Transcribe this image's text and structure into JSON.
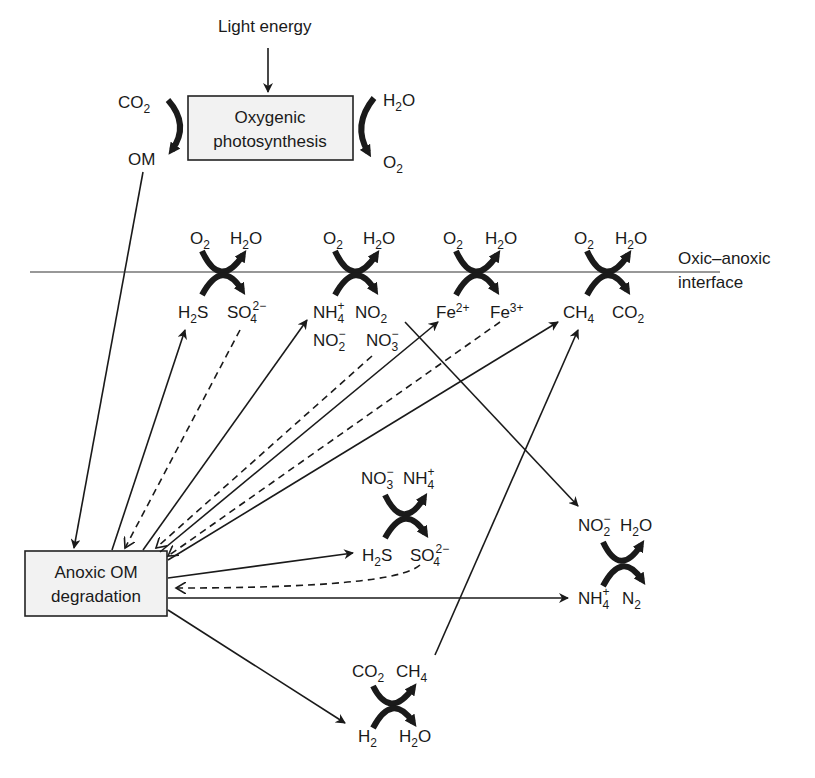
{
  "diagram": {
    "light_energy": "Light energy",
    "top_box": {
      "line1": "Oxygenic",
      "line2": "photosynthesis"
    },
    "top_left_in": {
      "base": "CO",
      "sub": "2"
    },
    "top_left_out": "OM",
    "top_right_in": {
      "base": "H",
      "sub": "2",
      "tail": "O"
    },
    "top_right_out": {
      "base": "O",
      "sub": "2"
    },
    "interface_label": {
      "line1": "Oxic–anoxic",
      "line2": "interface"
    },
    "oxic_reactions": [
      {
        "in_top": "O2",
        "out_top": "H2O",
        "in_bottom": "H2S",
        "out_bottom": "SO4 2−"
      },
      {
        "in_top": "O2",
        "out_top": "H2O",
        "in_bottom": "NH4+",
        "out_bottom": "NO2",
        "extra": [
          "NO2−",
          "NO3−"
        ]
      },
      {
        "in_top": "O2",
        "out_top": "H2O",
        "in_bottom": "Fe2+",
        "out_bottom": "Fe3+"
      },
      {
        "in_top": "O2",
        "out_top": "H2O",
        "in_bottom": "CH4",
        "out_bottom": "CO2"
      }
    ],
    "bottom_box": {
      "line1": "Anoxic OM",
      "line2": "degradation"
    },
    "anoxic_reactions": [
      {
        "name": "sulfide-oxidation-nitrate",
        "top": [
          "NO3−",
          "NH4+"
        ],
        "bottom": [
          "H2S",
          "SO4 2−"
        ]
      },
      {
        "name": "anammox",
        "top": [
          "NO2−",
          "H2O"
        ],
        "bottom": [
          "NH4+",
          "N2"
        ]
      },
      {
        "name": "methanogenesis",
        "top": [
          "CO2",
          "CH4"
        ],
        "bottom": [
          "H2",
          "H2O"
        ]
      }
    ],
    "text": {
      "O": "O",
      "H": "H",
      "S": "S",
      "SO": "SO",
      "NH": "NH",
      "NO": "NO",
      "Fe": "Fe",
      "CH": "CH",
      "CO": "CO",
      "s2": "2",
      "s3": "3",
      "s4": "4",
      "plus": "+",
      "minus": "−",
      "s2minus": "2−",
      "fe2": "2+",
      "fe3": "3+",
      "N": "N"
    }
  }
}
